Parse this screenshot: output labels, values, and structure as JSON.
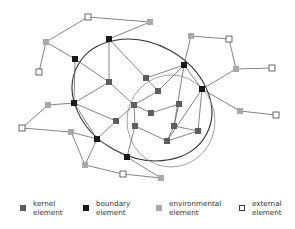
{
  "colors": {
    "kernel": "#5e5e5e",
    "boundary": "#1a1a1a",
    "environmental": "#aaaaaa",
    "external": "#ffffff",
    "edge": "#666666",
    "big_ellipse": "#333333",
    "small_ellipse": "#999999"
  },
  "legend": [
    {
      "type": "kernel",
      "line1": "kernel",
      "line2": "element",
      "x": 20
    },
    {
      "type": "boundary",
      "line1": "boundary",
      "line2": "element",
      "x": 83
    },
    {
      "type": "environmental",
      "line1": "environmental",
      "line2": "element",
      "x": 156
    },
    {
      "type": "external",
      "line1": "external",
      "line2": "element",
      "x": 239
    }
  ],
  "nodes": [
    {
      "id": "x1",
      "type": "external",
      "x": 88,
      "y": 17
    },
    {
      "id": "e1",
      "type": "environmental",
      "x": 150,
      "y": 22
    },
    {
      "id": "e2",
      "type": "environmental",
      "x": 46,
      "y": 42
    },
    {
      "id": "x2",
      "type": "external",
      "x": 39,
      "y": 72
    },
    {
      "id": "b1",
      "type": "boundary",
      "x": 109,
      "y": 39
    },
    {
      "id": "b2",
      "type": "boundary",
      "x": 75,
      "y": 59
    },
    {
      "id": "e3",
      "type": "environmental",
      "x": 191,
      "y": 36
    },
    {
      "id": "x3",
      "type": "external",
      "x": 229,
      "y": 39
    },
    {
      "id": "e4",
      "type": "environmental",
      "x": 236,
      "y": 69
    },
    {
      "id": "x4",
      "type": "external",
      "x": 272,
      "y": 68
    },
    {
      "id": "b3",
      "type": "boundary",
      "x": 184,
      "y": 65
    },
    {
      "id": "k1",
      "type": "kernel",
      "x": 109,
      "y": 82
    },
    {
      "id": "k2",
      "type": "kernel",
      "x": 146,
      "y": 78
    },
    {
      "id": "k3",
      "type": "kernel",
      "x": 158,
      "y": 91
    },
    {
      "id": "b4",
      "type": "boundary",
      "x": 202,
      "y": 89
    },
    {
      "id": "e5",
      "type": "environmental",
      "x": 240,
      "y": 111
    },
    {
      "id": "x5",
      "type": "external",
      "x": 276,
      "y": 115
    },
    {
      "id": "e6",
      "type": "environmental",
      "x": 48,
      "y": 105
    },
    {
      "id": "b5",
      "type": "boundary",
      "x": 74,
      "y": 103
    },
    {
      "id": "x6",
      "type": "external",
      "x": 22,
      "y": 128
    },
    {
      "id": "k4",
      "type": "kernel",
      "x": 134,
      "y": 105
    },
    {
      "id": "k5",
      "type": "kernel",
      "x": 179,
      "y": 104
    },
    {
      "id": "k6",
      "type": "kernel",
      "x": 151,
      "y": 113
    },
    {
      "id": "k7",
      "type": "kernel",
      "x": 116,
      "y": 121
    },
    {
      "id": "e7",
      "type": "environmental",
      "x": 71,
      "y": 132
    },
    {
      "id": "k8",
      "type": "kernel",
      "x": 135,
      "y": 126
    },
    {
      "id": "k9",
      "type": "kernel",
      "x": 174,
      "y": 126
    },
    {
      "id": "k10",
      "type": "kernel",
      "x": 198,
      "y": 131
    },
    {
      "id": "b6",
      "type": "boundary",
      "x": 97,
      "y": 139
    },
    {
      "id": "k11",
      "type": "kernel",
      "x": 167,
      "y": 141
    },
    {
      "id": "b7",
      "type": "boundary",
      "x": 127,
      "y": 157
    },
    {
      "id": "e8",
      "type": "environmental",
      "x": 85,
      "y": 165
    },
    {
      "id": "x7",
      "type": "external",
      "x": 123,
      "y": 174
    },
    {
      "id": "e9",
      "type": "environmental",
      "x": 161,
      "y": 178
    }
  ],
  "edges": [
    [
      "x1",
      "e1"
    ],
    [
      "x1",
      "e2"
    ],
    [
      "e2",
      "x2"
    ],
    [
      "e2",
      "b2"
    ],
    [
      "e1",
      "b1"
    ],
    [
      "b1",
      "k1"
    ],
    [
      "b1",
      "k2"
    ],
    [
      "b2",
      "k1"
    ],
    [
      "b2",
      "b5"
    ],
    [
      "e3",
      "b3"
    ],
    [
      "e3",
      "x3"
    ],
    [
      "x3",
      "e4"
    ],
    [
      "e4",
      "x4"
    ],
    [
      "e4",
      "b4"
    ],
    [
      "b3",
      "k3"
    ],
    [
      "b3",
      "b4"
    ],
    [
      "b3",
      "k9"
    ],
    [
      "b3",
      "k2"
    ],
    [
      "b4",
      "e5"
    ],
    [
      "e5",
      "x5"
    ],
    [
      "b4",
      "k10"
    ],
    [
      "b4",
      "k11"
    ],
    [
      "k1",
      "b5"
    ],
    [
      "k1",
      "k4"
    ],
    [
      "k2",
      "k3"
    ],
    [
      "k3",
      "k4"
    ],
    [
      "k4",
      "k6"
    ],
    [
      "k4",
      "k8"
    ],
    [
      "k4",
      "k7"
    ],
    [
      "k6",
      "k5"
    ],
    [
      "k5",
      "k9"
    ],
    [
      "k9",
      "k11"
    ],
    [
      "k9",
      "k10"
    ],
    [
      "k10",
      "k11"
    ],
    [
      "k8",
      "k11"
    ],
    [
      "k8",
      "b7"
    ],
    [
      "e6",
      "b5"
    ],
    [
      "e6",
      "x6"
    ],
    [
      "x6",
      "e7"
    ],
    [
      "e7",
      "b6"
    ],
    [
      "b5",
      "k7"
    ],
    [
      "b5",
      "b6"
    ],
    [
      "k7",
      "b6"
    ],
    [
      "b6",
      "b7"
    ],
    [
      "b6",
      "e8"
    ],
    [
      "e8",
      "x7"
    ],
    [
      "x7",
      "e9"
    ],
    [
      "b7",
      "e9"
    ],
    [
      "e8",
      "e7"
    ]
  ],
  "ellipses": [
    {
      "name": "boundary-region",
      "cx": 142,
      "cy": 100,
      "rx": 73,
      "ry": 57,
      "rotate": 28,
      "stroke": "#333333",
      "width": 1.1
    },
    {
      "name": "kernel-region",
      "cx": 171,
      "cy": 121,
      "rx": 44,
      "ry": 46,
      "rotate": 0,
      "stroke": "#999999",
      "width": 0.9
    }
  ]
}
